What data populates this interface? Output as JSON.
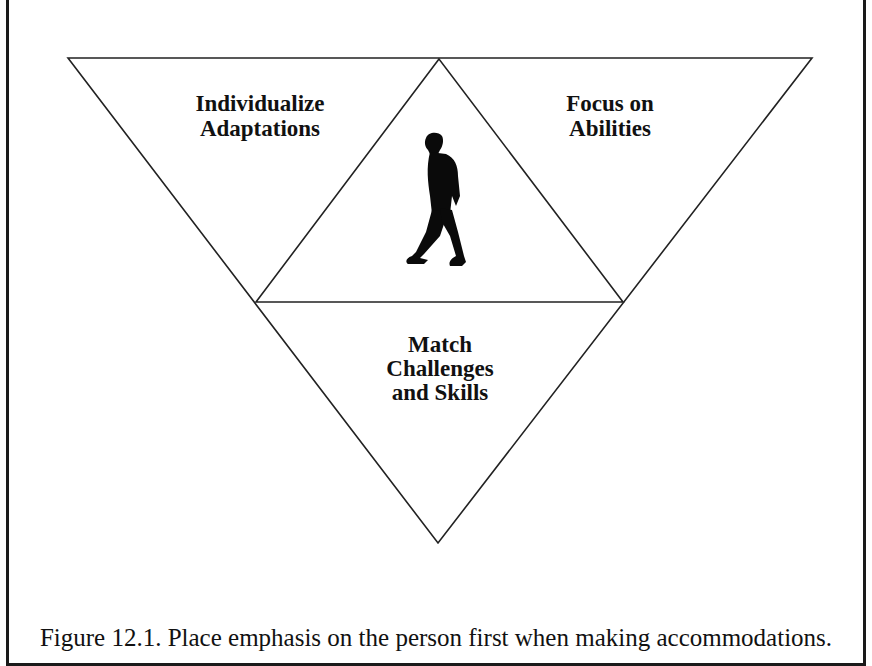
{
  "figure": {
    "segments": {
      "top_left": {
        "line1": "Individualize",
        "line2": "Adaptations"
      },
      "top_right": {
        "line1": "Focus on",
        "line2": "Abilities"
      },
      "bottom": {
        "line1": "Match",
        "line2": "Challenges",
        "line3": "and Skills"
      },
      "center": {
        "icon": "walking-person-icon"
      }
    },
    "caption": "Figure 12.1. Place emphasis on the person first when making accommodations."
  }
}
